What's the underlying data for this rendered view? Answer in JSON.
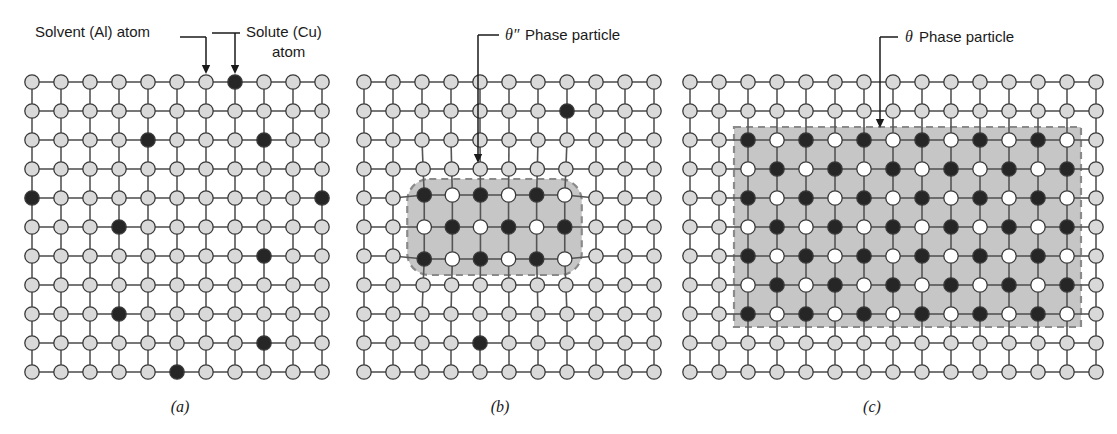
{
  "figure": {
    "caption_a": "(a)",
    "caption_b": "(b)",
    "caption_c": "(c)"
  },
  "colors": {
    "solvent_fill": "#d9d9d9",
    "solute_fill": "#262626",
    "white_atom_fill": "#ffffff",
    "atom_stroke": "#3a3a3a",
    "bond_stroke": "#555555",
    "particle_shade": "#c6c6c6",
    "dashed_stroke": "#8a8a8a",
    "text": "#1a1a1a",
    "background": "#ffffff"
  },
  "labels": {
    "solvent": "Solvent (Al) atom",
    "solute_line1": "Solute (Cu)",
    "solute_line2": "atom",
    "theta_double_prime_symbol": "θ″",
    "theta_double_prime_text": "Phase particle",
    "theta_symbol": "θ",
    "theta_text": "Phase particle"
  },
  "panel_a": {
    "name": "supersaturated-solid-solution",
    "origin_x": 32,
    "origin_y": 82,
    "spacing": 29,
    "cols": 11,
    "rows": 11,
    "solute_positions": [
      [
        7,
        0
      ],
      [
        4,
        2
      ],
      [
        8,
        2
      ],
      [
        0,
        4
      ],
      [
        10,
        4
      ],
      [
        3,
        5
      ],
      [
        8,
        6
      ],
      [
        3,
        8
      ],
      [
        8,
        9
      ],
      [
        5,
        10
      ]
    ]
  },
  "panel_b": {
    "name": "transition-theta-double-prime-phase",
    "origin_x": 364,
    "origin_y": 82,
    "spacing": 29,
    "cols": 11,
    "rows": 11,
    "solute_positions": [
      [
        7,
        1
      ],
      [
        4,
        9
      ]
    ],
    "particle": {
      "col_start": 2,
      "col_end": 7,
      "row_start": 4,
      "row_end": 6,
      "shape": "rounded",
      "pad_x": 17,
      "pad_y": 16,
      "corner_radius": 22,
      "row_offsets": [
        -3,
        0,
        3
      ],
      "checker_parity": 0
    },
    "leader": {
      "label_x": 505,
      "label_y": 40,
      "elbow_x": 492,
      "arrow_x": 493,
      "arrow_y_top": 47,
      "arrow_y_bottom": 163
    }
  },
  "panel_c": {
    "name": "equilibrium-theta-phase",
    "origin_x": 690,
    "origin_y": 82,
    "spacing": 29,
    "cols": 15,
    "rows": 11,
    "solute_positions": [],
    "particle": {
      "col_start": 2,
      "col_end": 13,
      "row_start": 2,
      "row_end": 8,
      "shape": "rect",
      "pad_x": 14,
      "pad_y": 13,
      "row_offsets": [
        0,
        17,
        0,
        17,
        0
      ],
      "checker_parity": 0,
      "band_rows": [
        2,
        3,
        4,
        5,
        6
      ]
    },
    "leader": {
      "label_x": 905,
      "label_y": 42,
      "elbow_x": 880,
      "arrow_x": 881,
      "arrow_y_top": 49,
      "arrow_y_bottom": 128
    }
  },
  "panel_a_leaders": {
    "solvent_label_x": 35,
    "solvent_label_y": 37,
    "solvent_line_x1": 180,
    "solvent_line_x2": 206,
    "solvent_arrow_x": 206,
    "solvent_arrow_y_top": 40,
    "solvent_arrow_y_bottom": 74,
    "solute_label_x": 246,
    "solute_label_y": 37,
    "solute_label2_x": 272,
    "solute_label2_y": 57,
    "solute_line_x1": 212,
    "solute_line_x2": 240,
    "solute_arrow_x": 235,
    "solute_arrow_y_top": 33,
    "solute_arrow_y_bottom": 74
  },
  "captions": {
    "a_x": 180,
    "a_y": 412,
    "b_x": 500,
    "b_y": 412,
    "c_x": 872,
    "c_y": 412
  }
}
